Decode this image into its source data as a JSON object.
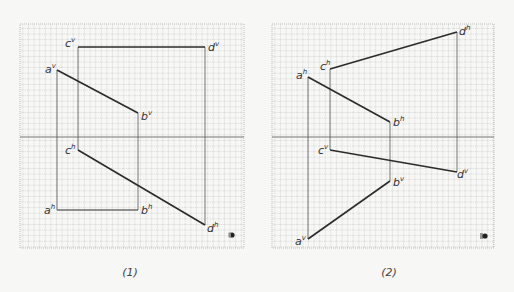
{
  "figures": [
    {
      "caption": "(1)",
      "grid": {
        "x": 20,
        "y": 24,
        "w": 224,
        "h": 224,
        "cell": 5.6
      },
      "axis_y": 137,
      "points": {
        "a_v": {
          "label": "a",
          "sup": "v",
          "x": 57,
          "y": 70
        },
        "b_v": {
          "label": "b",
          "sup": "v",
          "x": 138,
          "y": 113
        },
        "c_v": {
          "label": "c",
          "sup": "v",
          "x": 78,
          "y": 47
        },
        "d_v": {
          "label": "d",
          "sup": "v",
          "x": 205,
          "y": 47
        },
        "a_h": {
          "label": "a",
          "sup": "h",
          "x": 57,
          "y": 210
        },
        "b_h": {
          "label": "b",
          "sup": "h",
          "x": 138,
          "y": 210
        },
        "c_h": {
          "label": "c",
          "sup": "h",
          "x": 78,
          "y": 150
        },
        "d_h": {
          "label": "d",
          "sup": "h",
          "x": 205,
          "y": 225
        }
      }
    },
    {
      "caption": "(2)",
      "grid": {
        "x": 272,
        "y": 24,
        "w": 222,
        "h": 224,
        "cell": 5.6
      },
      "axis_y": 137,
      "points": {
        "a_h": {
          "label": "a",
          "sup": "h",
          "x": 308,
          "y": 77
        },
        "b_h": {
          "label": "b",
          "sup": "h",
          "x": 390,
          "y": 122
        },
        "c_h": {
          "label": "c",
          "sup": "h",
          "x": 330,
          "y": 69
        },
        "d_h": {
          "label": "d",
          "sup": "h",
          "x": 457,
          "y": 32
        },
        "a_v": {
          "label": "a",
          "sup": "v",
          "x": 308,
          "y": 239
        },
        "b_v": {
          "label": "b",
          "sup": "v",
          "x": 390,
          "y": 181
        },
        "c_v": {
          "label": "c",
          "sup": "v",
          "x": 330,
          "y": 150
        },
        "d_v": {
          "label": "d",
          "sup": "v",
          "x": 457,
          "y": 172
        }
      }
    }
  ],
  "labels": {
    "fig1": {
      "a_v": "a",
      "a_v_sup": "v",
      "b_v": "b",
      "b_v_sup": "v",
      "c_v": "c",
      "c_v_sup": "v",
      "d_v": "d",
      "d_v_sup": "v",
      "a_h": "a",
      "a_h_sup": "h",
      "b_h": "b",
      "b_h_sup": "h",
      "c_h": "c",
      "c_h_sup": "h",
      "d_h": "d",
      "d_h_sup": "h",
      "caption": "(1)"
    },
    "fig2": {
      "a_h": "a",
      "a_h_sup": "h",
      "b_h": "b",
      "b_h_sup": "h",
      "c_h": "c",
      "c_h_sup": "h",
      "d_h": "d",
      "d_h_sup": "h",
      "a_v": "a",
      "a_v_sup": "v",
      "b_v": "b",
      "b_v_sup": "v",
      "c_v": "c",
      "c_v_sup": "v",
      "d_v": "d",
      "d_v_sup": "v",
      "caption": "(2)"
    }
  },
  "colors": {
    "grid": "#9a9a9a",
    "line": "#2b2b2b",
    "projector": "#555555",
    "axis": "#777777",
    "background": "#f7f7f6"
  }
}
